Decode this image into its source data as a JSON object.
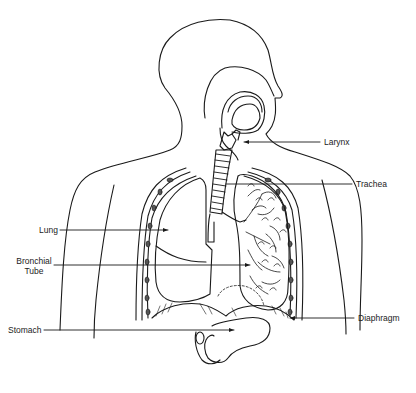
{
  "diagram": {
    "labels": [
      {
        "id": "larynx",
        "text": "Larynx"
      },
      {
        "id": "trachea",
        "text": "Trachea"
      },
      {
        "id": "lung",
        "text": "Lung"
      },
      {
        "id": "bronchial-tube",
        "line1": "Bronchial",
        "line2": "Tube"
      },
      {
        "id": "stomach",
        "text": "Stomach"
      },
      {
        "id": "diaphragm",
        "text": "Diaphragm"
      }
    ],
    "colors": {
      "ink": "#1a1a1a",
      "background": "#ffffff"
    }
  }
}
